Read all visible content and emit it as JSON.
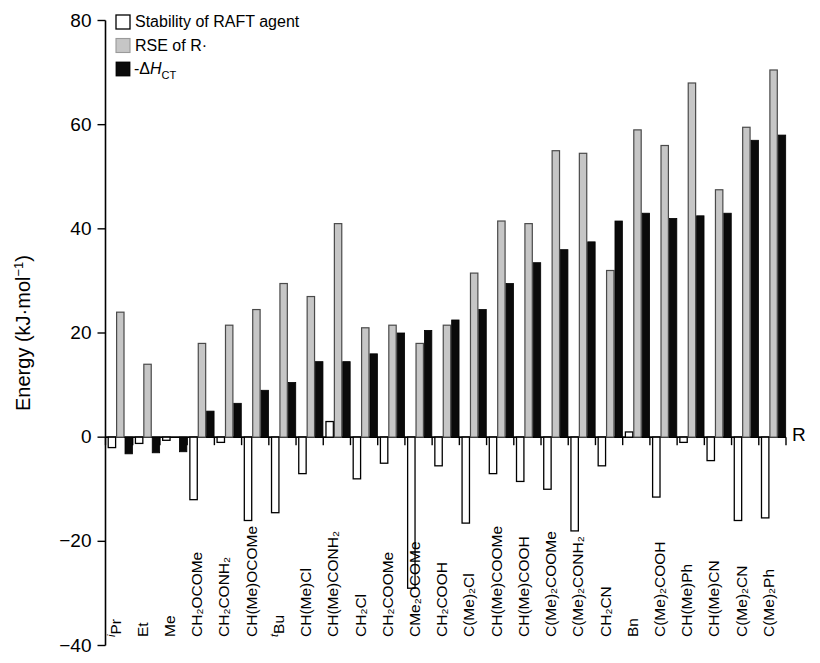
{
  "chart_data": {
    "type": "bar",
    "title": "",
    "xlabel": "R",
    "ylabel": "Energy (kJ·mol⁻¹)",
    "ylim": [
      -40,
      80
    ],
    "ytick_labels": [
      "80",
      "60",
      "40",
      "20",
      "0",
      "−20",
      "−40"
    ],
    "ytick_values": [
      80,
      60,
      40,
      20,
      0,
      -20,
      -40
    ],
    "grid": false,
    "legend_position": "top-left",
    "legend": [
      {
        "label": "Stability of RAFT agent",
        "swatch": "white",
        "color": "#ffffff"
      },
      {
        "label": "RSE of R·",
        "swatch": "gray",
        "color": "#c6c6c6"
      },
      {
        "label": "-ΔH_CT",
        "swatch": "black",
        "color": "#0a0a0a"
      }
    ],
    "categories": [
      "ⁱPr",
      "Et",
      "Me",
      "CH₂OCOMe",
      "CH₂CONH₂",
      "CH(Me)OCOMe",
      "ᵗBu",
      "CH(Me)Cl",
      "CH(Me)CONH₂",
      "CH₂Cl",
      "CH₂COOMe",
      "CMe₂OCOMe",
      "CH₂COOH",
      "C(Me)₂Cl",
      "CH(Me)COOMe",
      "CH(Me)COOH",
      "C(Me)₂COOMe",
      "C(Me)₂CONH₂",
      "CH₂CN",
      "Bn",
      "C(Me)₂COOH",
      "CH(Me)Ph",
      "CH(Me)CN",
      "C(Me)₂CN",
      "C(Me)₂Ph"
    ],
    "series": [
      {
        "name": "Stability of RAFT agent",
        "color": "#ffffff",
        "values": [
          -2.0,
          -1.2,
          -0.6,
          -12.0,
          -1.0,
          -16.0,
          -14.5,
          -7.0,
          3.0,
          -8.0,
          -5.0,
          -29.0,
          -5.5,
          -16.5,
          -7.0,
          -8.5,
          -10.0,
          -18.0,
          -5.5,
          1.0,
          -11.5,
          -1.0,
          -4.5,
          -16.0,
          -15.5
        ]
      },
      {
        "name": "RSE of R·",
        "color": "#c6c6c6",
        "values": [
          24.0,
          14.0,
          0.0,
          18.0,
          21.5,
          24.5,
          29.5,
          27.0,
          41.0,
          21.0,
          21.5,
          18.0,
          21.5,
          31.5,
          41.5,
          41.0,
          55.0,
          54.5,
          32.0,
          59.0,
          56.0,
          68.0,
          47.5,
          59.5,
          70.5
        ]
      },
      {
        "name": "-ΔH_CT",
        "color": "#0a0a0a",
        "values": [
          -3.2,
          -3.0,
          -2.8,
          5.0,
          6.5,
          9.0,
          10.5,
          14.5,
          14.5,
          16.0,
          20.0,
          20.5,
          22.5,
          24.5,
          29.5,
          33.5,
          36.0,
          37.5,
          41.5,
          43.0,
          42.0,
          42.5,
          43.0,
          57.0,
          58.0
        ]
      }
    ]
  }
}
